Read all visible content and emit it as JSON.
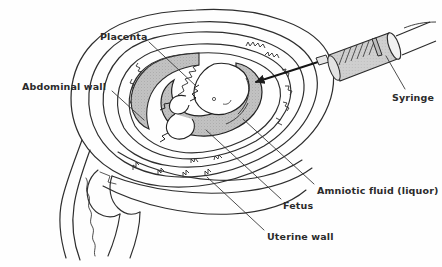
{
  "figure": {
    "background_color": "#fefefe",
    "ink_color": "#2b2b2b",
    "shade_color": "#b9b9b9",
    "labels": [
      {
        "id": "placenta",
        "text": "Placenta",
        "x": 100,
        "y": 31,
        "leader_from": [
          148,
          41
        ],
        "leader_to": [
          196,
          86
        ]
      },
      {
        "id": "abdominal-wall",
        "text": "Abdominal wall",
        "x": 22,
        "y": 81,
        "leader_from": [
          113,
          91
        ],
        "leader_to": [
          143,
          119
        ]
      },
      {
        "id": "syringe",
        "text": "Syringe",
        "x": 392,
        "y": 92,
        "leader_from": [
          404,
          90
        ],
        "leader_to": [
          386,
          57
        ]
      },
      {
        "id": "amniotic-fluid",
        "text": "Amniotic fluid (liquor)",
        "x": 317,
        "y": 185,
        "leader_from": [
          314,
          185
        ],
        "leader_to": [
          243,
          120
        ]
      },
      {
        "id": "fetus",
        "text": "Fetus",
        "x": 283,
        "y": 200,
        "leader_from": [
          281,
          200
        ],
        "leader_to": [
          206,
          130
        ]
      },
      {
        "id": "uterine-wall",
        "text": "Uterine wall",
        "x": 267,
        "y": 231,
        "leader_from": [
          264,
          231
        ],
        "leader_to": [
          207,
          178
        ]
      }
    ],
    "parts": [
      {
        "name": "abdominal-wall-outline"
      },
      {
        "name": "uterine-wall-outline"
      },
      {
        "name": "amniotic-sac-outline"
      },
      {
        "name": "placenta-shape"
      },
      {
        "name": "fetus-shape"
      },
      {
        "name": "syringe-barrel"
      },
      {
        "name": "syringe-plunger"
      },
      {
        "name": "syringe-needle"
      },
      {
        "name": "cervix-and-pelvic-floor"
      }
    ]
  }
}
